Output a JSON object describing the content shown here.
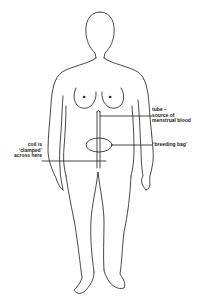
{
  "diagram": {
    "colors": {
      "line": "#1a1a1a",
      "background": "#ffffff"
    },
    "annotations": [
      {
        "id": "tube",
        "lines": [
          "tube –",
          "source of",
          "menstrual blood"
        ]
      },
      {
        "id": "breeding-bag",
        "lines": [
          "‘breeding bag’"
        ]
      },
      {
        "id": "coil",
        "lines": [
          "coil is",
          "‘clamped’",
          "across here"
        ]
      }
    ]
  }
}
